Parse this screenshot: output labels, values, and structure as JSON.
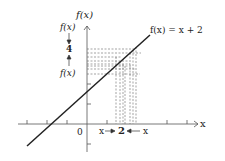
{
  "diagram": {
    "type": "function-limit-graph",
    "y_axis_label": "f(x)",
    "x_axis_label": "x",
    "origin_label": "0",
    "function_label": "f(x) = x + 2",
    "left_bracket": {
      "top": "f(x)",
      "middle": "4",
      "bottom": "f(x)"
    },
    "bottom_bracket": {
      "left": "x",
      "middle": "2",
      "right": "x"
    },
    "colors": {
      "line": "#222222",
      "axis": "#555555",
      "dashed": "#666666"
    }
  }
}
